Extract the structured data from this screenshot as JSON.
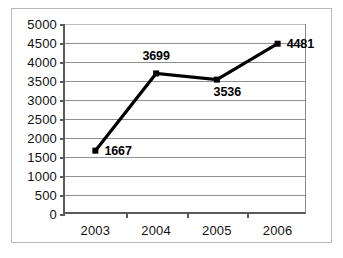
{
  "chart_data": {
    "type": "line",
    "title": "",
    "xlabel": "",
    "ylabel": "",
    "categories": [
      "2003",
      "2004",
      "2005",
      "2006"
    ],
    "values": [
      1667,
      3699,
      3536,
      4481
    ],
    "series": [
      {
        "name": "",
        "values": [
          1667,
          3699,
          3536,
          4481
        ]
      }
    ],
    "data_labels": [
      "1667",
      "3699",
      "3536",
      "4481"
    ],
    "data_label_positions": [
      "right",
      "above",
      "below",
      "right"
    ],
    "ylim": [
      0,
      5000
    ],
    "ytick_step": 500,
    "yticks": [
      0,
      500,
      1000,
      1500,
      2000,
      2500,
      3000,
      3500,
      4000,
      4500,
      5000
    ],
    "ytick_labels": [
      "0",
      "500",
      "1000",
      "1500",
      "2000",
      "2500",
      "3000",
      "3500",
      "4000",
      "4500",
      "5000"
    ],
    "grid": true,
    "grid_axis": "y",
    "legend": false,
    "legend_position": "none",
    "marker": "square",
    "colors": {
      "line": "#000000",
      "marker": "#000000",
      "grid": "#8f8f8f",
      "axis": "#5a5a5a",
      "frame": "#b9b9b9",
      "background": "#ffffff",
      "text": "#111111"
    }
  }
}
